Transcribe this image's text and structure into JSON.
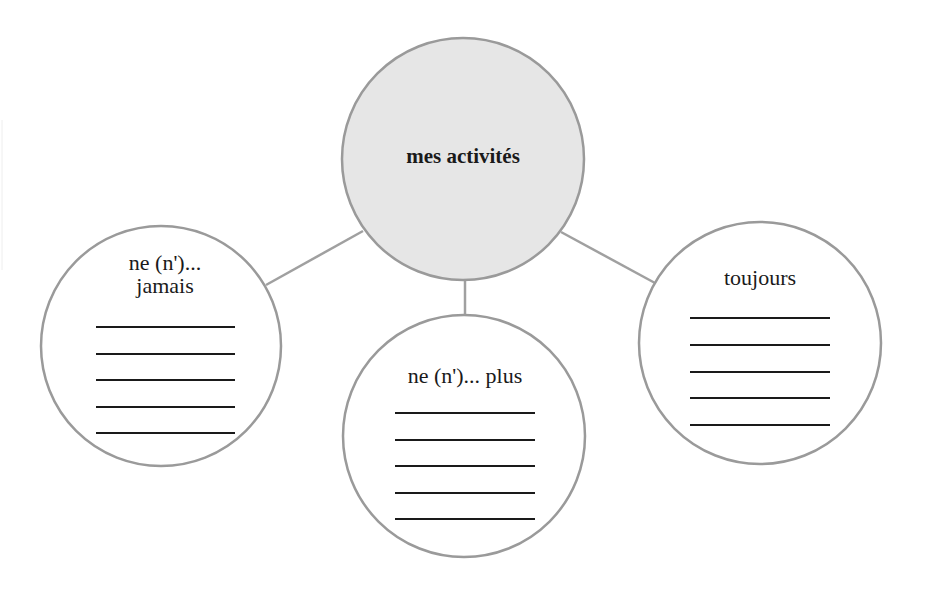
{
  "diagram": {
    "type": "mind-map",
    "hub": {
      "label": "mes activités",
      "fill": "#e6e6e6",
      "stroke": "#9a9a9a"
    },
    "branches": [
      {
        "id": "jamais",
        "label_line1": "ne (n')...",
        "label_line2": "jamais",
        "blank_lines": 5
      },
      {
        "id": "plus",
        "label_line1": "ne (n')... plus",
        "blank_lines": 5
      },
      {
        "id": "toujours",
        "label_line1": "toujours",
        "blank_lines": 5
      }
    ],
    "colors": {
      "circle_stroke": "#9a9a9a",
      "connector": "#a0a0a0",
      "text": "#1a1a1a",
      "write_line": "#1a1a1a"
    }
  }
}
